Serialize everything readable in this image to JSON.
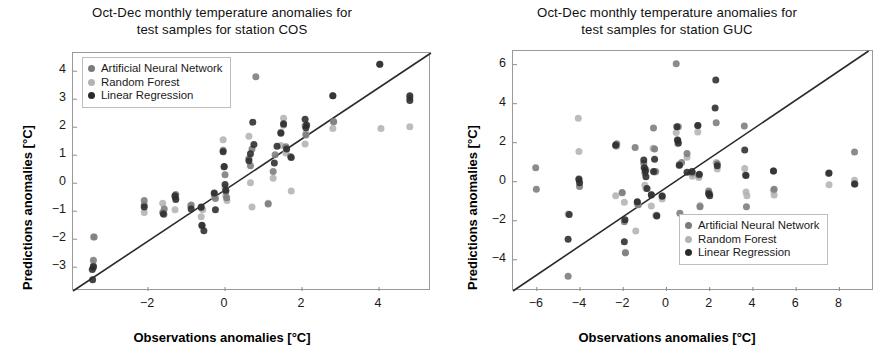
{
  "figure": {
    "series_colors": {
      "ann": "#7b7b7b",
      "rf": "#b3b3b3",
      "lr": "#2b2b2b",
      "identity_line": "#2a2a2a",
      "frame": "#9a9a9a"
    },
    "legend_labels": {
      "ann": "Artificial Neural Network",
      "rf": "Random Forest",
      "lr": "Linear Regression"
    }
  },
  "chart_data": [
    {
      "type": "scatter",
      "panel": "left",
      "station": "COS",
      "title": "Oct-Dec monthly temperature anomalies for test samples for station COS",
      "title_line1": "Oct-Dec monthly temperature anomalies for",
      "title_line2": "test samples for station COS",
      "xlabel": "Observations anomalies [°C]",
      "ylabel": "Predictions anomalies [°C]",
      "xlim": [
        -3.95,
        5.35
      ],
      "ylim": [
        -3.85,
        4.65
      ],
      "xticks": [
        -2,
        0,
        2,
        4
      ],
      "yticks": [
        -3,
        -2,
        -1,
        0,
        1,
        2,
        3,
        4
      ],
      "xticklabels": [
        "−2",
        "0",
        "2",
        "4"
      ],
      "yticklabels": [
        "−3",
        "−2",
        "−1",
        "0",
        "1",
        "2",
        "3",
        "4"
      ],
      "grid": false,
      "legend_position": "upper-left",
      "identity_line": {
        "from": [
          -3.95,
          -3.85
        ],
        "to": [
          5.35,
          4.65
        ],
        "label": "1:1 line"
      },
      "series": [
        {
          "name": "Artificial Neural Network",
          "key": "ann",
          "color": "#7b7b7b",
          "points": [
            [
              -3.42,
              -2.95
            ],
            [
              -3.42,
              -2.75
            ],
            [
              -3.4,
              -1.92
            ],
            [
              -2.1,
              -0.62
            ],
            [
              -2.1,
              -0.78
            ],
            [
              -1.62,
              -1.05
            ],
            [
              -1.58,
              -0.92
            ],
            [
              -1.3,
              -0.48
            ],
            [
              -1.28,
              -0.4
            ],
            [
              -0.88,
              -0.78
            ],
            [
              -0.62,
              -0.88
            ],
            [
              -0.6,
              -1.52
            ],
            [
              -0.28,
              -0.38
            ],
            [
              -0.25,
              -0.55
            ],
            [
              -0.05,
              1.18
            ],
            [
              -0.03,
              0.58
            ],
            [
              0.0,
              0.3
            ],
            [
              0.02,
              -0.3
            ],
            [
              0.04,
              -0.52
            ],
            [
              0.62,
              0.88
            ],
            [
              0.66,
              0.62
            ],
            [
              0.7,
              1.22
            ],
            [
              0.8,
              3.8
            ],
            [
              1.12,
              -0.74
            ],
            [
              1.25,
              0.42
            ],
            [
              1.3,
              1.02
            ],
            [
              1.45,
              1.82
            ],
            [
              1.52,
              2.08
            ],
            [
              1.58,
              1.3
            ],
            [
              1.7,
              0.95
            ],
            [
              2.08,
              2.05
            ],
            [
              2.1,
              1.72
            ],
            [
              2.8,
              3.12
            ],
            [
              2.82,
              2.2
            ],
            [
              4.02,
              4.25
            ],
            [
              4.8,
              3.05
            ]
          ]
        },
        {
          "name": "Random Forest",
          "key": "rf",
          "color": "#b3b3b3",
          "points": [
            [
              -3.42,
              -1.92
            ],
            [
              -3.42,
              -3.02
            ],
            [
              -2.1,
              -1.05
            ],
            [
              -1.62,
              -0.72
            ],
            [
              -1.58,
              -1.12
            ],
            [
              -1.3,
              -0.95
            ],
            [
              -1.28,
              -0.52
            ],
            [
              -0.9,
              -0.82
            ],
            [
              -0.62,
              -1.2
            ],
            [
              -0.58,
              -0.95
            ],
            [
              -0.28,
              -0.48
            ],
            [
              -0.05,
              1.55
            ],
            [
              0.0,
              -0.15
            ],
            [
              0.02,
              -0.45
            ],
            [
              0.05,
              -0.62
            ],
            [
              0.62,
              1.68
            ],
            [
              0.66,
              0.02
            ],
            [
              0.7,
              -0.85
            ],
            [
              1.12,
              -0.72
            ],
            [
              1.25,
              0.18
            ],
            [
              1.45,
              1.35
            ],
            [
              1.52,
              2.32
            ],
            [
              1.58,
              1.08
            ],
            [
              1.72,
              -0.28
            ],
            [
              2.08,
              1.4
            ],
            [
              2.1,
              1.78
            ],
            [
              2.8,
              1.95
            ],
            [
              2.82,
              2.18
            ],
            [
              4.05,
              1.95
            ],
            [
              4.8,
              2.02
            ]
          ]
        },
        {
          "name": "Linear Regression",
          "key": "lr",
          "color": "#2b2b2b",
          "points": [
            [
              -3.45,
              -3.08
            ],
            [
              -3.44,
              -3.45
            ],
            [
              -3.42,
              -2.98
            ],
            [
              -2.1,
              -0.85
            ],
            [
              -1.6,
              -1.1
            ],
            [
              -1.3,
              -0.45
            ],
            [
              -1.28,
              -0.58
            ],
            [
              -0.88,
              -0.92
            ],
            [
              -0.62,
              -0.85
            ],
            [
              -0.6,
              -1.5
            ],
            [
              -0.55,
              -1.7
            ],
            [
              -0.28,
              -0.35
            ],
            [
              -0.25,
              -0.95
            ],
            [
              -0.05,
              1.12
            ],
            [
              -0.02,
              0.6
            ],
            [
              0.0,
              -0.05
            ],
            [
              0.02,
              -0.25
            ],
            [
              0.62,
              0.8
            ],
            [
              0.66,
              1.05
            ],
            [
              0.72,
              2.18
            ],
            [
              0.75,
              1.38
            ],
            [
              1.28,
              0.72
            ],
            [
              1.35,
              1.32
            ],
            [
              1.45,
              1.78
            ],
            [
              1.52,
              2.12
            ],
            [
              1.6,
              1.22
            ],
            [
              1.72,
              0.92
            ],
            [
              2.08,
              2.28
            ],
            [
              2.1,
              1.98
            ],
            [
              2.12,
              2.08
            ],
            [
              2.8,
              3.12
            ],
            [
              4.02,
              4.25
            ],
            [
              4.8,
              3.12
            ],
            [
              4.8,
              2.95
            ]
          ]
        }
      ]
    },
    {
      "type": "scatter",
      "panel": "right",
      "station": "GUC",
      "title": "Oct-Dec monthly temperature anomalies for test samples for station GUC",
      "title_line1": "Oct-Dec monthly temperature anomalies for",
      "title_line2": "test samples for station GUC",
      "xlabel": "Observations anomalies [°C]",
      "ylabel": "Predictions anomalies [°C]",
      "xlim": [
        -7.1,
        9.6
      ],
      "ylim": [
        -5.6,
        6.7
      ],
      "xticks": [
        -6,
        -4,
        -2,
        0,
        2,
        4,
        6,
        8
      ],
      "yticks": [
        -4,
        -2,
        0,
        2,
        4,
        6
      ],
      "xticklabels": [
        "−6",
        "−4",
        "−2",
        "0",
        "2",
        "4",
        "6",
        "8"
      ],
      "yticklabels": [
        "−4",
        "−2",
        "0",
        "2",
        "4",
        "6"
      ],
      "grid": false,
      "legend_position": "lower-right",
      "identity_line": {
        "from": [
          -7.1,
          -5.6
        ],
        "to": [
          9.35,
          6.7
        ],
        "label": "1:1 line"
      },
      "series": [
        {
          "name": "Artificial Neural Network",
          "key": "ann",
          "color": "#7b7b7b",
          "points": [
            [
              -6.05,
              0.72
            ],
            [
              -6.02,
              -0.38
            ],
            [
              -4.55,
              -4.85
            ],
            [
              -4.05,
              0.15
            ],
            [
              -4.02,
              -0.25
            ],
            [
              -2.35,
              1.85
            ],
            [
              -2.3,
              1.95
            ],
            [
              -2.05,
              -0.55
            ],
            [
              -1.95,
              -2.05
            ],
            [
              -1.9,
              -3.65
            ],
            [
              -1.45,
              1.75
            ],
            [
              -1.35,
              -1.05
            ],
            [
              -1.3,
              -1.18
            ],
            [
              -1.05,
              0.95
            ],
            [
              -1.0,
              0.45
            ],
            [
              -0.95,
              0.62
            ],
            [
              -0.7,
              -0.65
            ],
            [
              -0.6,
              2.75
            ],
            [
              -0.55,
              1.68
            ],
            [
              -0.5,
              0.52
            ],
            [
              -0.45,
              -1.72
            ],
            [
              -0.2,
              -0.72
            ],
            [
              0.45,
              6.05
            ],
            [
              0.5,
              2.15
            ],
            [
              0.55,
              2.82
            ],
            [
              0.6,
              0.88
            ],
            [
              0.62,
              -1.62
            ],
            [
              0.7,
              0.98
            ],
            [
              0.95,
              1.45
            ],
            [
              1.2,
              0.45
            ],
            [
              1.45,
              2.88
            ],
            [
              1.5,
              0.35
            ],
            [
              1.55,
              -1.28
            ],
            [
              1.95,
              -0.48
            ],
            [
              2.0,
              -0.62
            ],
            [
              2.3,
              3.02
            ],
            [
              2.35,
              0.92
            ],
            [
              3.6,
              2.85
            ],
            [
              3.65,
              0.35
            ],
            [
              3.7,
              -1.28
            ],
            [
              4.95,
              0.55
            ],
            [
              4.98,
              -0.38
            ],
            [
              7.5,
              0.42
            ],
            [
              8.7,
              1.52
            ],
            [
              8.72,
              -0.12
            ]
          ]
        },
        {
          "name": "Random Forest",
          "key": "rf",
          "color": "#b3b3b3",
          "points": [
            [
              -4.55,
              -1.65
            ],
            [
              -4.08,
              3.25
            ],
            [
              -4.05,
              1.55
            ],
            [
              -2.35,
              -0.72
            ],
            [
              -2.3,
              1.82
            ],
            [
              -2.05,
              -0.58
            ],
            [
              -1.95,
              -1.05
            ],
            [
              -1.9,
              -3.62
            ],
            [
              -1.42,
              -2.52
            ],
            [
              -1.35,
              -1.15
            ],
            [
              -1.05,
              0.72
            ],
            [
              -1.0,
              -0.18
            ],
            [
              -0.95,
              -0.35
            ],
            [
              -0.7,
              -1.25
            ],
            [
              -0.62,
              1.72
            ],
            [
              -0.55,
              0.48
            ],
            [
              -0.5,
              -1.72
            ],
            [
              -0.2,
              -0.88
            ],
            [
              0.45,
              2.52
            ],
            [
              0.52,
              1.95
            ],
            [
              0.58,
              0.85
            ],
            [
              0.95,
              1.25
            ],
            [
              1.2,
              0.28
            ],
            [
              1.45,
              2.55
            ],
            [
              1.5,
              0.22
            ],
            [
              1.55,
              -1.22
            ],
            [
              1.95,
              -0.55
            ],
            [
              2.3,
              0.98
            ],
            [
              2.35,
              0.65
            ],
            [
              3.62,
              0.68
            ],
            [
              3.68,
              -0.52
            ],
            [
              3.72,
              -0.72
            ],
            [
              4.95,
              -0.45
            ],
            [
              4.98,
              -0.68
            ],
            [
              7.52,
              -0.15
            ],
            [
              8.7,
              0.08
            ]
          ]
        },
        {
          "name": "Linear Regression",
          "key": "lr",
          "color": "#2b2b2b",
          "points": [
            [
              -4.55,
              -2.95
            ],
            [
              -4.5,
              -1.68
            ],
            [
              -4.05,
              0.12
            ],
            [
              -4.02,
              -0.05
            ],
            [
              -2.35,
              1.88
            ],
            [
              -1.95,
              -3.08
            ],
            [
              -1.92,
              -1.95
            ],
            [
              -1.35,
              -1.02
            ],
            [
              -1.05,
              1.12
            ],
            [
              -1.02,
              0.72
            ],
            [
              -0.98,
              0.55
            ],
            [
              -0.95,
              0.25
            ],
            [
              -0.9,
              -0.35
            ],
            [
              -0.7,
              -0.68
            ],
            [
              -0.6,
              0.52
            ],
            [
              -0.55,
              1.15
            ],
            [
              -0.45,
              -1.75
            ],
            [
              -0.2,
              -0.75
            ],
            [
              0.48,
              2.82
            ],
            [
              0.52,
              2.12
            ],
            [
              0.55,
              1.98
            ],
            [
              0.6,
              0.85
            ],
            [
              0.95,
              0.48
            ],
            [
              1.18,
              0.52
            ],
            [
              1.45,
              2.88
            ],
            [
              1.52,
              0.38
            ],
            [
              1.95,
              -0.62
            ],
            [
              2.0,
              -0.72
            ],
            [
              2.25,
              3.78
            ],
            [
              2.28,
              5.22
            ],
            [
              2.35,
              0.82
            ],
            [
              3.62,
              1.62
            ],
            [
              3.68,
              0.32
            ],
            [
              4.95,
              0.55
            ],
            [
              7.52,
              0.45
            ],
            [
              8.7,
              -0.12
            ]
          ]
        }
      ]
    }
  ]
}
